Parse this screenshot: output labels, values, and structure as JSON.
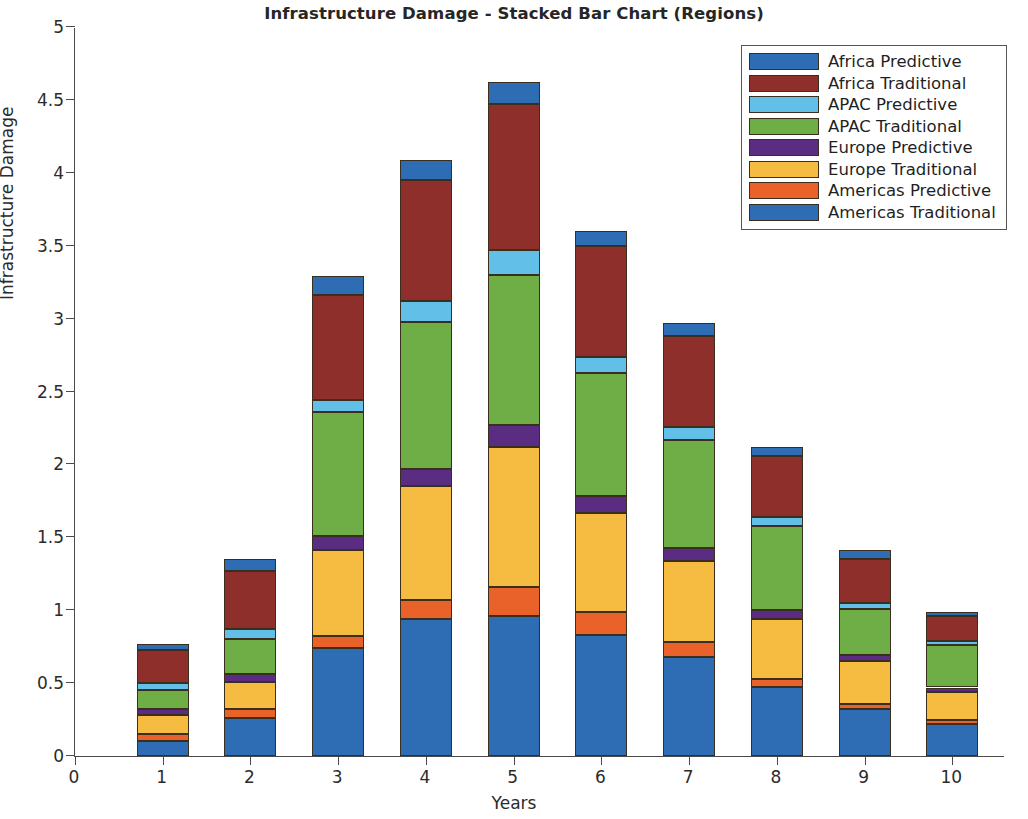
{
  "chart_data": {
    "type": "bar",
    "stacked": true,
    "title": "Infrastructure Damage - Stacked Bar Chart (Regions)",
    "xlabel": "Years",
    "ylabel": "Infrastructure Damage",
    "xlim": [
      0,
      10.6
    ],
    "ylim": [
      0,
      5
    ],
    "grid": false,
    "legend_position": "top-right",
    "x_ticks": [
      "0",
      "1",
      "2",
      "3",
      "4",
      "5",
      "6",
      "7",
      "8",
      "9",
      "10"
    ],
    "x_tick_values": [
      0,
      1,
      2,
      3,
      4,
      5,
      6,
      7,
      8,
      9,
      10
    ],
    "y_ticks": [
      "0",
      "0.5",
      "1",
      "1.5",
      "2",
      "2.5",
      "3",
      "3.5",
      "4",
      "4.5",
      "5"
    ],
    "y_tick_values": [
      0,
      0.5,
      1,
      1.5,
      2,
      2.5,
      3,
      3.5,
      4,
      4.5,
      5
    ],
    "categories": [
      1,
      2,
      3,
      4,
      5,
      6,
      7,
      8,
      9,
      10
    ],
    "series": [
      {
        "name": "Americas Traditional",
        "color": "#2e6db4",
        "values": [
          0.1,
          0.26,
          0.74,
          0.94,
          0.96,
          0.83,
          0.68,
          0.47,
          0.32,
          0.22
        ]
      },
      {
        "name": "Americas Predictive",
        "color": "#e8622a",
        "values": [
          0.05,
          0.06,
          0.08,
          0.13,
          0.2,
          0.16,
          0.1,
          0.06,
          0.04,
          0.03
        ]
      },
      {
        "name": "Europe Traditional",
        "color": "#f5bc41",
        "values": [
          0.13,
          0.19,
          0.59,
          0.78,
          0.96,
          0.68,
          0.56,
          0.41,
          0.29,
          0.19
        ]
      },
      {
        "name": "Europe Predictive",
        "color": "#5b2d82",
        "values": [
          0.04,
          0.05,
          0.1,
          0.12,
          0.15,
          0.11,
          0.09,
          0.06,
          0.04,
          0.03
        ]
      },
      {
        "name": "APAC Traditional",
        "color": "#6fae46",
        "values": [
          0.13,
          0.24,
          0.85,
          1.01,
          1.03,
          0.85,
          0.74,
          0.58,
          0.32,
          0.29
        ]
      },
      {
        "name": "APAC Predictive",
        "color": "#62bfe8",
        "values": [
          0.05,
          0.07,
          0.08,
          0.14,
          0.17,
          0.11,
          0.09,
          0.06,
          0.04,
          0.03
        ]
      },
      {
        "name": "Africa Traditional",
        "color": "#8e2f2b",
        "values": [
          0.23,
          0.4,
          0.72,
          0.83,
          1.0,
          0.76,
          0.62,
          0.42,
          0.3,
          0.17
        ]
      },
      {
        "name": "Africa Predictive",
        "color": "#2e6db4",
        "values": [
          0.04,
          0.08,
          0.13,
          0.14,
          0.15,
          0.1,
          0.09,
          0.06,
          0.06,
          0.03
        ]
      }
    ],
    "totals": [
      0.77,
      1.35,
      3.29,
      4.09,
      4.62,
      3.6,
      2.97,
      2.12,
      1.41,
      0.99
    ]
  },
  "legend": {
    "entries": [
      {
        "label": "Africa Predictive",
        "color": "#2e6db4"
      },
      {
        "label": "Africa Traditional",
        "color": "#8e2f2b"
      },
      {
        "label": "APAC Predictive",
        "color": "#62bfe8"
      },
      {
        "label": "APAC Traditional",
        "color": "#6fae46"
      },
      {
        "label": "Europe Predictive",
        "color": "#5b2d82"
      },
      {
        "label": "Europe Traditional",
        "color": "#f5bc41"
      },
      {
        "label": "Americas Predictive",
        "color": "#e8622a"
      },
      {
        "label": "Americas Traditional",
        "color": "#2e6db4"
      }
    ]
  }
}
